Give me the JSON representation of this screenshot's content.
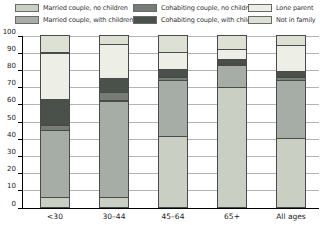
{
  "chart_data": {
    "type": "bar",
    "stacked": true,
    "title": "",
    "xlabel": "",
    "ylabel": "",
    "categories": [
      "<30",
      "30–44",
      "45–64",
      "65+",
      "All ages"
    ],
    "series": [
      {
        "name": "Married couple, no children",
        "color": "#c9cfc2",
        "values": [
          6,
          6,
          41,
          70,
          40
        ]
      },
      {
        "name": "Married couple, with children",
        "color": "#a6ada6",
        "values": [
          39,
          56,
          33,
          13,
          34
        ]
      },
      {
        "name": "Cohabiting couple, no children",
        "color": "#767d76",
        "values": [
          3,
          5,
          2,
          1,
          2
        ]
      },
      {
        "name": "Cohabiting couple, with children",
        "color": "#4a514b",
        "values": [
          15,
          8,
          4,
          2,
          3
        ]
      },
      {
        "name": "Lone parent",
        "color": "#edeee5",
        "values": [
          27,
          20,
          10,
          6,
          15
        ]
      },
      {
        "name": "Not in family",
        "color": "#dde1d3",
        "values": [
          10,
          5,
          10,
          8,
          6
        ]
      }
    ],
    "ylim": [
      0,
      100
    ],
    "yticks": [
      "0",
      "10",
      "20",
      "30",
      "40",
      "50",
      "60",
      "70",
      "80",
      "90",
      "100"
    ],
    "grid": true,
    "legend_position": "top",
    "legend_columns": [
      [
        0,
        1
      ],
      [
        2,
        3
      ],
      [
        4,
        5
      ]
    ]
  },
  "style": {
    "gridline_color": "#b3b3b3",
    "axis_color": "#000000",
    "segment_border_color": "#4a4a4a"
  }
}
